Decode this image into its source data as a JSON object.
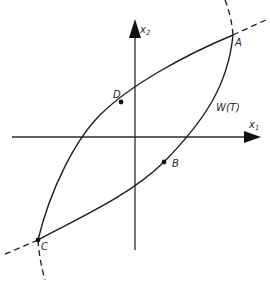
{
  "diagram": {
    "axes": {
      "x1": {
        "label": "x",
        "subscript": "1"
      },
      "x2": {
        "label": "x",
        "subscript": "2"
      }
    },
    "points": [
      {
        "id": "A",
        "label": "A"
      },
      {
        "id": "B",
        "label": "B"
      },
      {
        "id": "C",
        "label": "C"
      },
      {
        "id": "D",
        "label": "D"
      }
    ],
    "region_label": "W(T)",
    "colors": {
      "stroke": "#1e1e1e",
      "background": "#ffffff"
    }
  }
}
